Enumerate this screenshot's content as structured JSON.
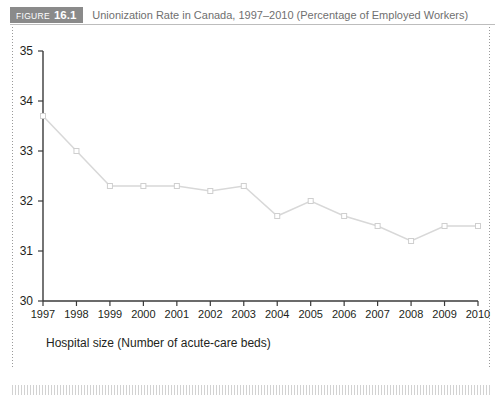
{
  "header": {
    "figure_word": "FIGURE",
    "figure_number": "16.1",
    "title": "Unionization Rate in Canada, 1997–2010 (Percentage of Employed Workers)",
    "badge_color": "#8a8a8a",
    "title_color": "#6f6f6f"
  },
  "chart_data": {
    "type": "line",
    "title": "Unionization Rate in Canada, 1997–2010 (Percentage of Employed Workers)",
    "xlabel": "Hospital size (Number of acute-care beds)",
    "ylabel": "",
    "categories": [
      "1997",
      "1998",
      "1999",
      "2000",
      "2001",
      "2002",
      "2003",
      "2004",
      "2005",
      "2006",
      "2007",
      "2008",
      "2009",
      "2010"
    ],
    "values": [
      33.7,
      33.0,
      32.3,
      32.3,
      32.3,
      32.2,
      32.3,
      31.7,
      32.0,
      31.7,
      31.5,
      31.2,
      31.5,
      31.5
    ],
    "ylim": [
      30,
      35
    ],
    "yticks": [
      "30",
      "31",
      "32",
      "33",
      "34",
      "35"
    ],
    "xlim": [
      "1997",
      "2010"
    ],
    "grid": false,
    "legend": "none",
    "line_color": "#d8d8d8",
    "marker": "square",
    "marker_fill": "#ffffff",
    "marker_edge": "#cfcfcf",
    "axis_color": "#3a3a3a"
  }
}
